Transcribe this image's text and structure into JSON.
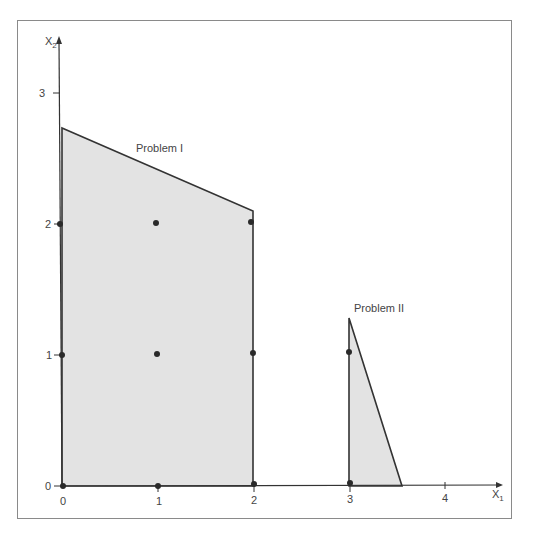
{
  "diagram": {
    "axes": {
      "x_label": "X",
      "x_subscript": "1",
      "y_label": "X",
      "y_subscript": "2",
      "x_ticks": [
        "0",
        "1",
        "2",
        "3",
        "4"
      ],
      "y_ticks": [
        "0",
        "1",
        "2",
        "3"
      ]
    },
    "regions": [
      {
        "name": "Problem I",
        "vertices": [
          [
            0,
            0
          ],
          [
            0,
            2.73
          ],
          [
            2,
            2.1
          ],
          [
            2,
            0
          ]
        ]
      },
      {
        "name": "Problem II",
        "vertices": [
          [
            3,
            0
          ],
          [
            3,
            1.3
          ],
          [
            3.55,
            0
          ]
        ]
      }
    ],
    "lattice_points": [
      [
        0,
        0
      ],
      [
        1,
        0
      ],
      [
        2,
        0
      ],
      [
        0,
        1
      ],
      [
        1,
        1
      ],
      [
        2,
        1
      ],
      [
        0,
        2
      ],
      [
        1,
        2
      ],
      [
        2,
        2
      ],
      [
        3,
        0
      ],
      [
        3,
        1
      ]
    ],
    "colors": {
      "fill": "#e3e3e3",
      "stroke": "#333333",
      "point": "#2a2a2a",
      "frame": "#8a8a8a"
    }
  }
}
